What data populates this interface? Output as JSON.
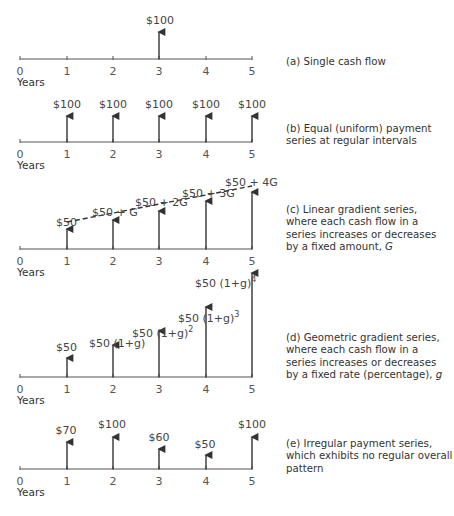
{
  "panels": [
    {
      "id": "a",
      "caption": "(a) Single cash flow",
      "axis_label": "Years",
      "ticks": [
        "0",
        "1",
        "2",
        "3",
        "4",
        "5"
      ],
      "flows": [
        {
          "year": 3,
          "label": "$100"
        }
      ]
    },
    {
      "id": "b",
      "caption_line1": "(b) Equal (uniform) payment",
      "caption_line2": "series at regular intervals",
      "axis_label": "Years",
      "ticks": [
        "0",
        "1",
        "2",
        "3",
        "4",
        "5"
      ],
      "flows": [
        {
          "year": 1,
          "label": "$100"
        },
        {
          "year": 2,
          "label": "$100"
        },
        {
          "year": 3,
          "label": "$100"
        },
        {
          "year": 4,
          "label": "$100"
        },
        {
          "year": 5,
          "label": "$100"
        }
      ]
    },
    {
      "id": "c",
      "caption_line1": "(c) Linear gradient series,",
      "caption_line2": "where each cash flow in a",
      "caption_line3": "series increases or decreases",
      "caption_line4_prefix": "by a fixed amount, ",
      "caption_line4_var": "G",
      "axis_label": "Years",
      "ticks": [
        "0",
        "1",
        "2",
        "3",
        "4",
        "5"
      ],
      "flows": [
        {
          "year": 1,
          "label": "$50"
        },
        {
          "year": 2,
          "label": "$50 + G"
        },
        {
          "year": 3,
          "label": "$50 + 2G"
        },
        {
          "year": 4,
          "label": "$50 + 3G"
        },
        {
          "year": 5,
          "label": "$50 + 4G"
        }
      ]
    },
    {
      "id": "d",
      "caption_line1": "(d) Geometric gradient series,",
      "caption_line2": "where each cash flow in a",
      "caption_line3": "series increases or decreases",
      "caption_line4_prefix": "by a fixed rate (percentage), ",
      "caption_line4_var": "g",
      "axis_label": "Years",
      "ticks": [
        "0",
        "1",
        "2",
        "3",
        "4",
        "5"
      ],
      "flows": [
        {
          "year": 1,
          "label": "$50"
        },
        {
          "year": 2,
          "label": "$50 (1+g)"
        },
        {
          "year": 3,
          "label": "$50 (1+g)",
          "exp": "2"
        },
        {
          "year": 4,
          "label": "$50 (1+g)",
          "exp": "3"
        },
        {
          "year": 5,
          "label": "$50 (1+g)",
          "exp": "4"
        }
      ]
    },
    {
      "id": "e",
      "caption_line1": "(e) Irregular payment series,",
      "caption_line2": "which exhibits no regular overall",
      "caption_line3": "pattern",
      "axis_label": "Years",
      "ticks": [
        "0",
        "1",
        "2",
        "3",
        "4",
        "5"
      ],
      "flows": [
        {
          "year": 1,
          "label": "$70"
        },
        {
          "year": 2,
          "label": "$100"
        },
        {
          "year": 3,
          "label": "$60"
        },
        {
          "year": 4,
          "label": "$50"
        },
        {
          "year": 5,
          "label": "$100"
        }
      ]
    }
  ],
  "colors": {
    "axis": "#555555",
    "arrow": "#333333",
    "text": "#444444"
  }
}
